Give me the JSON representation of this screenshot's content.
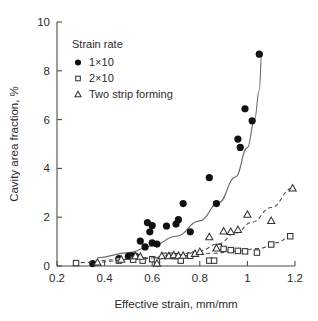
{
  "chart_data": {
    "type": "scatter",
    "title": "",
    "xlabel": "Effective strain, mm/mm",
    "ylabel": "Cavity area fraction, %",
    "xlim": [
      0.2,
      1.2
    ],
    "ylim": [
      0,
      10
    ],
    "xticks": [
      0.2,
      0.4,
      0.6,
      0.8,
      1.0,
      1.2
    ],
    "xtick_labels": [
      "0.2",
      "0.4",
      "0.6",
      "0.8",
      "1",
      "1.2"
    ],
    "yticks": [
      0,
      2,
      4,
      6,
      8,
      10
    ],
    "ytick_labels": [
      "0",
      "2",
      "4",
      "6",
      "8",
      "10"
    ],
    "grid": false,
    "legend_position": "upper-left",
    "legend": {
      "title": "Strain rate",
      "entries": [
        {
          "label": "1×10",
          "marker": "filled-circle"
        },
        {
          "label": "2×10",
          "marker": "open-square"
        },
        {
          "label": "Two strip forming",
          "marker": "open-triangle"
        }
      ]
    },
    "series": [
      {
        "name": "1×10",
        "marker": "filled-circle",
        "line_style": "solid",
        "points": [
          [
            0.35,
            0.1
          ],
          [
            0.46,
            0.3
          ],
          [
            0.5,
            0.4
          ],
          [
            0.51,
            0.42
          ],
          [
            0.52,
            0.42
          ],
          [
            0.53,
            0.4
          ],
          [
            0.55,
            1.02
          ],
          [
            0.57,
            0.78
          ],
          [
            0.58,
            1.78
          ],
          [
            0.59,
            1.4
          ],
          [
            0.6,
            1.66
          ],
          [
            0.6,
            0.95
          ],
          [
            0.62,
            0.9
          ],
          [
            0.66,
            1.64
          ],
          [
            0.7,
            1.72
          ],
          [
            0.71,
            1.9
          ],
          [
            0.73,
            2.56
          ],
          [
            0.76,
            1.4
          ],
          [
            0.84,
            3.62
          ],
          [
            0.87,
            2.56
          ],
          [
            0.96,
            5.2
          ],
          [
            0.97,
            4.86
          ],
          [
            0.99,
            6.44
          ],
          [
            1.02,
            5.95
          ],
          [
            1.05,
            8.68
          ]
        ],
        "fit_curve": [
          [
            0.37,
            0.34
          ],
          [
            0.5,
            0.55
          ],
          [
            0.6,
            0.82
          ],
          [
            0.7,
            1.22
          ],
          [
            0.8,
            1.85
          ],
          [
            0.88,
            2.6
          ],
          [
            0.95,
            3.65
          ],
          [
            1.0,
            4.85
          ],
          [
            1.03,
            6.0
          ],
          [
            1.05,
            7.2
          ],
          [
            1.06,
            8.7
          ]
        ]
      },
      {
        "name": "2×10",
        "marker": "open-square",
        "line_style": "dashed",
        "points": [
          [
            0.28,
            0.12
          ],
          [
            0.46,
            0.22
          ],
          [
            0.52,
            0.26
          ],
          [
            0.56,
            0.22
          ],
          [
            0.6,
            0.28
          ],
          [
            0.62,
            0.22
          ],
          [
            0.65,
            0.42
          ],
          [
            0.68,
            0.42
          ],
          [
            0.7,
            0.4
          ],
          [
            0.72,
            0.22
          ],
          [
            0.76,
            0.42
          ],
          [
            0.84,
            0.22
          ],
          [
            0.86,
            0.22
          ],
          [
            0.88,
            0.78
          ],
          [
            0.9,
            0.7
          ],
          [
            0.93,
            0.65
          ],
          [
            0.96,
            0.62
          ],
          [
            0.99,
            0.6
          ],
          [
            1.04,
            0.55
          ],
          [
            1.1,
            0.88
          ],
          [
            1.18,
            1.22
          ]
        ],
        "fit_curve": [
          [
            0.3,
            0.14
          ],
          [
            0.45,
            0.26
          ],
          [
            0.6,
            0.34
          ],
          [
            0.72,
            0.42
          ],
          [
            0.85,
            0.52
          ],
          [
            0.95,
            0.6
          ],
          [
            1.05,
            0.72
          ],
          [
            1.12,
            0.95
          ],
          [
            1.19,
            1.25
          ]
        ]
      },
      {
        "name": "Two strip forming",
        "marker": "open-triangle",
        "line_style": "dashed",
        "points": [
          [
            0.37,
            0.14
          ],
          [
            0.47,
            0.26
          ],
          [
            0.53,
            0.4
          ],
          [
            0.55,
            0.38
          ],
          [
            0.62,
            0.1
          ],
          [
            0.64,
            0.4
          ],
          [
            0.67,
            0.4
          ],
          [
            0.69,
            0.44
          ],
          [
            0.71,
            0.42
          ],
          [
            0.73,
            0.42
          ],
          [
            0.78,
            0.5
          ],
          [
            0.8,
            0.58
          ],
          [
            0.84,
            1.18
          ],
          [
            0.87,
            0.72
          ],
          [
            0.9,
            1.42
          ],
          [
            0.93,
            1.4
          ],
          [
            0.96,
            1.48
          ],
          [
            1.0,
            2.1
          ],
          [
            1.1,
            1.85
          ],
          [
            1.19,
            3.18
          ]
        ],
        "fit_curve": [
          [
            0.36,
            0.16
          ],
          [
            0.55,
            0.3
          ],
          [
            0.7,
            0.44
          ],
          [
            0.8,
            0.62
          ],
          [
            0.88,
            0.92
          ],
          [
            0.95,
            1.35
          ],
          [
            1.02,
            1.8
          ],
          [
            1.1,
            2.4
          ],
          [
            1.19,
            3.2
          ]
        ]
      }
    ]
  }
}
